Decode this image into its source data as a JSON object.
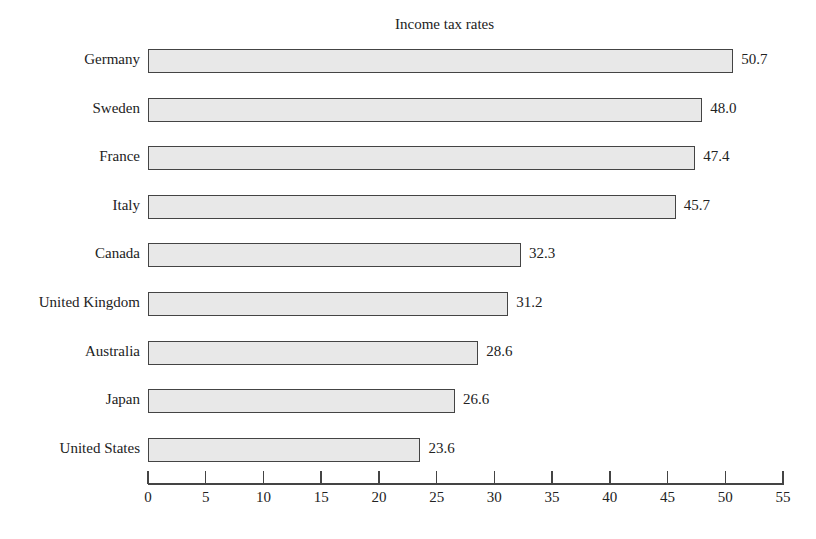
{
  "chart_data": {
    "type": "bar",
    "orientation": "horizontal",
    "title": "Income tax rates",
    "xlabel": "",
    "ylabel": "",
    "xlim": [
      0,
      55
    ],
    "xticks": [
      0,
      5,
      10,
      15,
      20,
      25,
      30,
      35,
      40,
      45,
      50,
      55
    ],
    "grid": false,
    "legend": null,
    "categories": [
      "Germany",
      "Sweden",
      "France",
      "Italy",
      "Canada",
      "United Kingdom",
      "Australia",
      "Japan",
      "United States"
    ],
    "values": [
      50.7,
      48.0,
      47.4,
      45.7,
      32.3,
      31.2,
      28.6,
      26.6,
      23.6
    ],
    "value_labels": [
      "50.7",
      "48.0",
      "47.4",
      "45.7",
      "32.3",
      "31.2",
      "28.6",
      "26.6",
      "23.6"
    ]
  }
}
